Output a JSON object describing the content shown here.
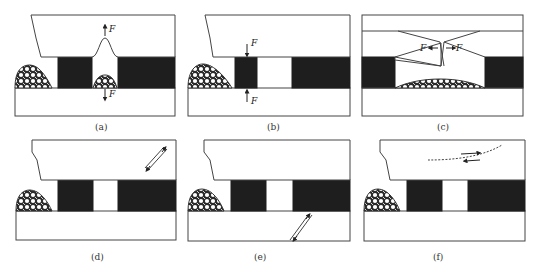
{
  "figure": {
    "colors": {
      "coal": "#1e1e1e",
      "line": "#444444",
      "background": "#ffffff"
    },
    "panels": [
      {
        "id": "a",
        "label": "(a)",
        "force_labels": [
          "F",
          "F"
        ],
        "feature": "roof bulge upward and floor heave with rubble between pillars"
      },
      {
        "id": "b",
        "label": "(b)",
        "force_labels": [
          "F",
          "F"
        ],
        "feature": "vertical compression of narrow pillar"
      },
      {
        "id": "c",
        "label": "(c)",
        "force_labels": [
          "F",
          "F"
        ],
        "feature": "roof tension crack with horizontal forces"
      },
      {
        "id": "d",
        "label": "(d)",
        "force_labels": [],
        "feature": "shear slip in roof"
      },
      {
        "id": "e",
        "label": "(e)",
        "force_labels": [],
        "feature": "shear slip in floor"
      },
      {
        "id": "f",
        "label": "(f)",
        "force_labels": [],
        "feature": "bedding-plane slip along dashed line in roof"
      }
    ]
  }
}
